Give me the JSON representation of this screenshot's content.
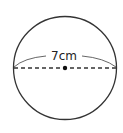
{
  "figure": {
    "type": "circle-diameter-diagram",
    "diameter_label": "7cm",
    "colors": {
      "stroke": "#333333",
      "background": "#ffffff",
      "center_dot": "#111111"
    }
  }
}
